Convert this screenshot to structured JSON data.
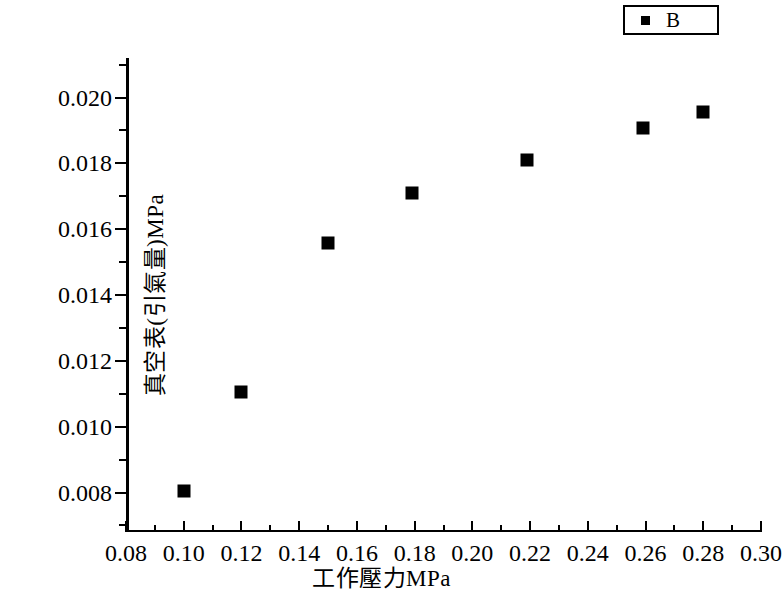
{
  "legend": {
    "entries": [
      {
        "label": "B",
        "marker": "filled-square",
        "color": "#000000"
      }
    ]
  },
  "axes": {
    "x_title": "工作壓力MPa",
    "y_title": "真空表(引氣量)MPa",
    "x_ticks": [
      "0.08",
      "0.10",
      "0.12",
      "0.14",
      "0.16",
      "0.18",
      "0.20",
      "0.22",
      "0.24",
      "0.26",
      "0.28",
      "0.30"
    ],
    "y_ticks": [
      "0.008",
      "0.010",
      "0.012",
      "0.014",
      "0.016",
      "0.018",
      "0.020"
    ]
  },
  "chart_data": {
    "type": "scatter",
    "title": "",
    "xlabel": "工作壓力MPa",
    "ylabel": "真空表(引氣量)MPa",
    "xlim": [
      0.08,
      0.3
    ],
    "ylim": [
      0.0068,
      0.0212
    ],
    "x_tick_step": 0.02,
    "x_minor_tick_step": 0.01,
    "y_tick_step": 0.002,
    "y_minor_tick_step": 0.001,
    "grid": false,
    "legend_position": "top-right",
    "series": [
      {
        "name": "B",
        "marker": "square",
        "color": "#000000",
        "x": [
          0.1,
          0.12,
          0.15,
          0.179,
          0.219,
          0.259,
          0.28
        ],
        "y": [
          0.00805,
          0.01105,
          0.01557,
          0.0171,
          0.0181,
          0.01908,
          0.01957
        ]
      }
    ]
  }
}
